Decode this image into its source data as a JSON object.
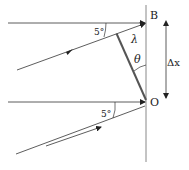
{
  "diagram": {
    "labels": {
      "point_top": "B",
      "point_bottom": "O",
      "angle_top": "5°",
      "angle_bottom": "5°",
      "wavelength": "λ",
      "theta": "θ",
      "delta_x": "Δx"
    },
    "colors": {
      "line": "#333333",
      "mirror": "#888888",
      "thick": "#555555"
    }
  }
}
